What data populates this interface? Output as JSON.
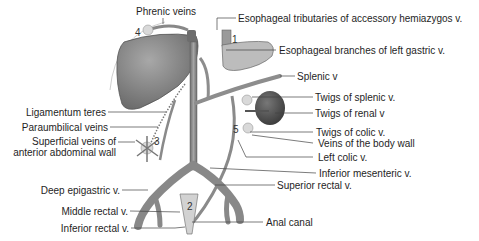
{
  "diagram": {
    "colors": {
      "vessel": "#8e8e8e",
      "vessel_dark": "#6f6f6f",
      "liver": "#7d7d7d",
      "stomach": "#b9b9b9",
      "kidney": "#4f4f4f",
      "anastomosis_site": "#d6d6d6",
      "leader_line": "#444444"
    },
    "sites": [
      "1",
      "2",
      "3",
      "4",
      "5"
    ],
    "labels": {
      "phrenic_veins": "Phrenic veins",
      "esophageal_tributaries": "Esophageal tributaries of accessory hemiazygos v.",
      "esophageal_branches": "Esophageal branches of left gastric v.",
      "splenic_v": "Splenic v",
      "ligamentum_teres": "Ligamentum teres",
      "twigs_splenic": "Twigs of splenic v.",
      "paraumbilical_veins": "Paraumbilical veins",
      "twigs_renal": "Twigs of renal v",
      "superficial_veins_line1": "Superficial veins of",
      "superficial_veins_line2": "anterior abdominal wall",
      "twigs_colic": "Twigs of colic v.",
      "veins_body_wall": "Veins of the body wall",
      "left_colic": "Left colic v.",
      "inferior_mesenteric": "Inferior mesenteric v.",
      "deep_epigastric": "Deep epigastric v.",
      "superior_rectal": "Superior rectal v.",
      "middle_rectal": "Middle rectal v.",
      "anal_canal": "Anal canal",
      "inferior_rectal": "Inferior rectal v."
    }
  }
}
